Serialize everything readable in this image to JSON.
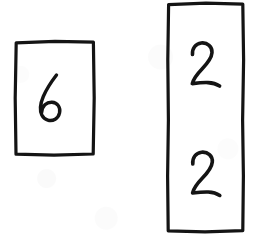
{
  "image": {
    "kind": "hand-drawn-diagram",
    "medium": "ink on white paper",
    "width": 259,
    "height": 248,
    "background_color": "#ffffff",
    "ink_color": "#141414"
  },
  "shapes": [
    {
      "id": "left-box",
      "name": "left-rectangle",
      "type": "rectangle",
      "x": 15,
      "y": 41,
      "width": 79,
      "height": 114,
      "stroke_color": "#141414",
      "stroke_width": 3,
      "fill": "none",
      "contents": [
        "6"
      ],
      "content_count": 1
    },
    {
      "id": "right-box",
      "name": "right-rectangle",
      "type": "rectangle",
      "x": 167,
      "y": 3,
      "width": 77,
      "height": 229,
      "stroke_color": "#141414",
      "stroke_width": 3,
      "fill": "none",
      "contents": [
        "2",
        "2"
      ],
      "content_count": 2
    }
  ],
  "digits": [
    {
      "id": "digit-six",
      "name": "digit-6-in-left-box",
      "value": "6",
      "container": "left-box",
      "center_x": 50,
      "center_y": 98,
      "color": "#141414"
    },
    {
      "id": "digit-two-upper",
      "name": "digit-2-upper-in-right-box",
      "value": "2",
      "container": "right-box",
      "center_x": 205,
      "center_y": 66,
      "color": "#141414"
    },
    {
      "id": "digit-two-lower",
      "name": "digit-2-lower-in-right-box",
      "value": "2",
      "container": "right-box",
      "center_x": 205,
      "center_y": 175,
      "color": "#141414"
    }
  ]
}
